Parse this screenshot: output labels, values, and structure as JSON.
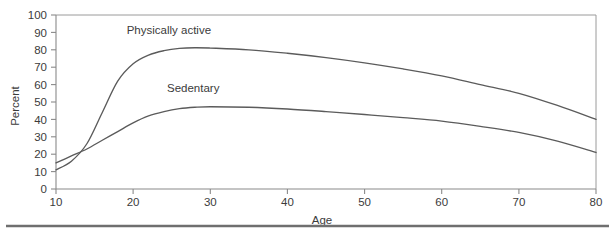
{
  "chart_data": {
    "type": "line",
    "title": "",
    "xlabel": "Age",
    "ylabel": "Percent",
    "xlim": [
      10,
      80
    ],
    "ylim": [
      0,
      100
    ],
    "xticks": [
      10,
      20,
      30,
      40,
      50,
      60,
      70,
      80
    ],
    "xtick_labels": [
      "10",
      "20",
      "30",
      "40",
      "50",
      "60",
      "70",
      "80"
    ],
    "yticks": [
      0,
      10,
      20,
      30,
      40,
      50,
      60,
      70,
      80,
      90,
      100
    ],
    "ytick_labels": [
      "0",
      "10",
      "20",
      "30",
      "40",
      "50",
      "60",
      "70",
      "80",
      "90",
      "100"
    ],
    "grid": false,
    "legend_position": "inline-annotation",
    "x": [
      10,
      12,
      14,
      16,
      18,
      20,
      22,
      24,
      26,
      28,
      30,
      35,
      40,
      45,
      50,
      55,
      60,
      65,
      70,
      75,
      80
    ],
    "series": [
      {
        "name": "Physically active",
        "label_x": 26,
        "label_y": 89,
        "color": "#5b5b5b",
        "values": [
          11,
          16,
          26,
          44,
          62,
          72,
          77,
          79.5,
          80.8,
          81.2,
          81,
          80,
          78,
          75.5,
          72.5,
          69,
          65,
          60,
          55,
          48,
          40
        ]
      },
      {
        "name": "Sedentary",
        "label_x": 28,
        "label_y": 56,
        "color": "#5b5b5b",
        "values": [
          15,
          19,
          23,
          28,
          33,
          38,
          42,
          44.5,
          46.2,
          47,
          47.3,
          47,
          46,
          44.5,
          42.8,
          41,
          39,
          36,
          32.5,
          27.5,
          21
        ]
      }
    ],
    "annotations": [
      {
        "text": "Physically active",
        "x": 26,
        "y": 89
      },
      {
        "text": "Sedentary",
        "x": 28,
        "y": 56
      }
    ]
  },
  "figure": {
    "axis_label_x": "Age",
    "axis_label_y": "Percent",
    "series_label_active": "Physically active",
    "series_label_sedentary": "Sedentary"
  }
}
